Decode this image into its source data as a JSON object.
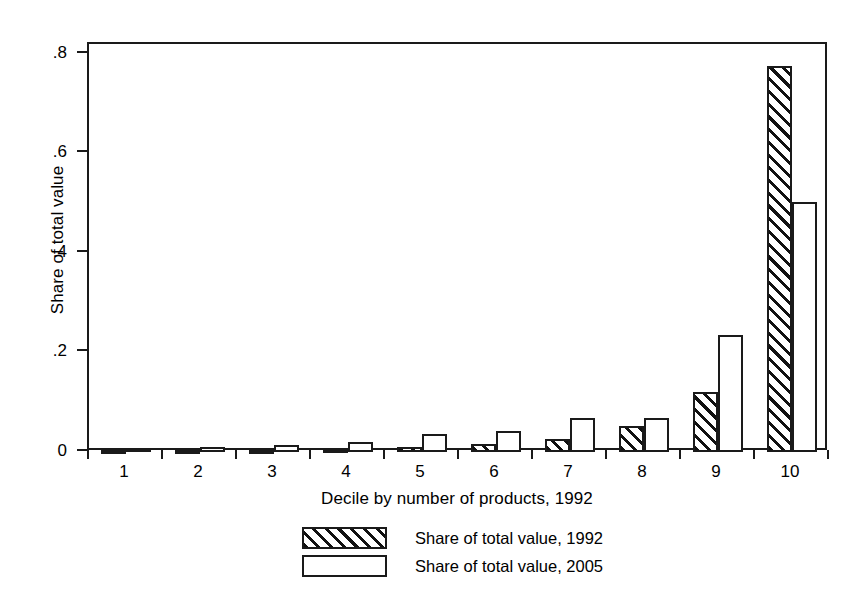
{
  "chart_data": {
    "type": "bar",
    "title": "",
    "subtitle": "",
    "xlabel": "Decile by number of products, 1992",
    "ylabel": "Share of total value",
    "categories": [
      "1",
      "2",
      "3",
      "4",
      "5",
      "6",
      "7",
      "8",
      "9",
      "10"
    ],
    "series": [
      {
        "name": "Share of total value, 1992",
        "fill": "hatched",
        "values": [
          0.003,
          0.003,
          0.004,
          0.006,
          0.01,
          0.016,
          0.027,
          0.053,
          0.12,
          0.775
        ]
      },
      {
        "name": "Share of total value, 2005",
        "fill": "white",
        "values": [
          0.009,
          0.01,
          0.014,
          0.021,
          0.037,
          0.042,
          0.068,
          0.068,
          0.236,
          0.503
        ]
      }
    ],
    "ylim": [
      0,
      0.82
    ],
    "yticks": [
      0,
      0.2,
      0.4,
      0.6,
      0.8
    ],
    "ytick_labels": [
      "0",
      ".2",
      ".4",
      ".6",
      ".8"
    ],
    "xtick_labels": [
      "1",
      "2",
      "3",
      "4",
      "5",
      "6",
      "7",
      "8",
      "9",
      "10"
    ],
    "grid": false,
    "legend_position": "bottom-center",
    "colors": {
      "axis": "#1a1a1a",
      "bar_outline": "#1a1a1a",
      "hatch": "#111111",
      "background": "#ffffff"
    }
  },
  "legend": {
    "entries": [
      {
        "label": "Share of total value, 1992",
        "fill": "hatched"
      },
      {
        "label": "Share of total value, 2005",
        "fill": "white"
      }
    ]
  }
}
